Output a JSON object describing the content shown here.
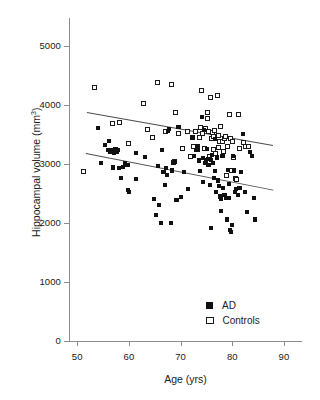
{
  "chart_data": {
    "type": "scatter",
    "title": "",
    "xlabel": "Age (yrs)",
    "ylabel_text": "Hippocampal volume (mm",
    "ylabel_sup": "3",
    "ylabel_tail": ")",
    "xlim": [
      50,
      95
    ],
    "ylim": [
      0,
      5400
    ],
    "xticks": [
      50,
      60,
      70,
      80,
      90
    ],
    "yticks": [
      0,
      1000,
      2000,
      3000,
      4000,
      5000
    ],
    "xtick_labels": [
      "50",
      "60",
      "70",
      "80",
      "90"
    ],
    "ytick_labels": [
      "0",
      "1000",
      "2000",
      "3000",
      "4000",
      "5000"
    ],
    "grid": false,
    "legend_position": "lower-right",
    "series": [
      {
        "name": "AD",
        "marker": "filled-square",
        "color": "#111111",
        "points": [
          [
            54.1,
            3610
          ],
          [
            54.6,
            3020
          ],
          [
            55.4,
            3320
          ],
          [
            55.9,
            3240
          ],
          [
            56.2,
            3390
          ],
          [
            56.4,
            3200
          ],
          [
            56.7,
            3230
          ],
          [
            56.9,
            2940
          ],
          [
            57.1,
            3180
          ],
          [
            57.4,
            3260
          ],
          [
            57.6,
            3210
          ],
          [
            57.9,
            3230
          ],
          [
            58.1,
            2930
          ],
          [
            58.4,
            2760
          ],
          [
            58.9,
            2950
          ],
          [
            59.3,
            3010
          ],
          [
            59.6,
            2990
          ],
          [
            59.8,
            2990
          ],
          [
            59.9,
            2560
          ],
          [
            60.1,
            2520
          ],
          [
            61.3,
            3190
          ],
          [
            61.4,
            2750
          ],
          [
            63.2,
            3120
          ],
          [
            64.8,
            2410
          ],
          [
            65.2,
            2130
          ],
          [
            65.6,
            2960
          ],
          [
            65.9,
            2310
          ],
          [
            66.2,
            2000
          ],
          [
            66.4,
            3240
          ],
          [
            66.7,
            2870
          ],
          [
            66.9,
            2650
          ],
          [
            67.1,
            2930
          ],
          [
            67.4,
            2810
          ],
          [
            67.6,
            3560
          ],
          [
            67.8,
            3590
          ],
          [
            68.2,
            2000
          ],
          [
            68.4,
            2890
          ],
          [
            68.9,
            3030
          ],
          [
            69.2,
            2390
          ],
          [
            69.6,
            3620
          ],
          [
            70.1,
            2440
          ],
          [
            70.6,
            2870
          ],
          [
            71.4,
            2570
          ],
          [
            72.3,
            3450
          ],
          [
            72.6,
            3140
          ],
          [
            72.9,
            3240
          ],
          [
            73.1,
            3300
          ],
          [
            73.4,
            3230
          ],
          [
            73.6,
            3060
          ],
          [
            73.8,
            2880
          ],
          [
            74.1,
            3790
          ],
          [
            74.3,
            3100
          ],
          [
            74.4,
            2700
          ],
          [
            74.6,
            3570
          ],
          [
            74.8,
            3020
          ],
          [
            74.9,
            3060
          ],
          [
            75.1,
            3250
          ],
          [
            75.3,
            3090
          ],
          [
            75.4,
            2980
          ],
          [
            75.6,
            3080
          ],
          [
            75.7,
            2650
          ],
          [
            75.8,
            1920
          ],
          [
            75.9,
            3070
          ],
          [
            76.1,
            3160
          ],
          [
            76.3,
            3020
          ],
          [
            76.4,
            2760
          ],
          [
            76.6,
            2880
          ],
          [
            76.7,
            3420
          ],
          [
            76.9,
            2520
          ],
          [
            77.1,
            3110
          ],
          [
            77.3,
            2720
          ],
          [
            77.4,
            2630
          ],
          [
            77.6,
            2450
          ],
          [
            77.8,
            2410
          ],
          [
            77.9,
            2200
          ],
          [
            78.1,
            3140
          ],
          [
            78.2,
            2600
          ],
          [
            78.4,
            2480
          ],
          [
            78.6,
            2470
          ],
          [
            78.7,
            2420
          ],
          [
            78.9,
            2060
          ],
          [
            79.1,
            2900
          ],
          [
            79.3,
            2660
          ],
          [
            79.4,
            2420
          ],
          [
            79.6,
            1880
          ],
          [
            79.7,
            1840
          ],
          [
            79.9,
            1970
          ],
          [
            80.2,
            3140
          ],
          [
            80.4,
            2890
          ],
          [
            80.6,
            2530
          ],
          [
            80.8,
            2580
          ],
          [
            81.1,
            2470
          ],
          [
            81.4,
            2600
          ],
          [
            81.6,
            2860
          ],
          [
            82.1,
            3510
          ],
          [
            82.4,
            2520
          ],
          [
            82.9,
            2190
          ],
          [
            83.4,
            3210
          ],
          [
            83.8,
            3130
          ],
          [
            84.2,
            2420
          ],
          [
            84.4,
            2060
          ]
        ]
      },
      {
        "name": "Controls",
        "marker": "open-square",
        "color": "#ffffff",
        "points": [
          [
            51.3,
            2870
          ],
          [
            53.3,
            4290
          ],
          [
            56.9,
            3690
          ],
          [
            58.1,
            3700
          ],
          [
            59.9,
            3340
          ],
          [
            62.9,
            4030
          ],
          [
            63.6,
            3590
          ],
          [
            64.6,
            3450
          ],
          [
            65.6,
            4390
          ],
          [
            67.1,
            3560
          ],
          [
            68.3,
            4350
          ],
          [
            68.6,
            3030
          ],
          [
            68.8,
            3040
          ],
          [
            69.1,
            3880
          ],
          [
            69.6,
            3510
          ],
          [
            70.4,
            3270
          ],
          [
            71.3,
            3560
          ],
          [
            71.9,
            3120
          ],
          [
            72.4,
            3290
          ],
          [
            72.9,
            3550
          ],
          [
            73.3,
            3300
          ],
          [
            73.6,
            3450
          ],
          [
            73.9,
            3620
          ],
          [
            74.1,
            4250
          ],
          [
            74.3,
            3520
          ],
          [
            74.6,
            3270
          ],
          [
            74.9,
            3610
          ],
          [
            75.1,
            3770
          ],
          [
            75.2,
            3880
          ],
          [
            75.4,
            3560
          ],
          [
            75.6,
            3130
          ],
          [
            75.8,
            4120
          ],
          [
            75.9,
            3440
          ],
          [
            76.1,
            3530
          ],
          [
            76.3,
            3460
          ],
          [
            76.4,
            3240
          ],
          [
            76.6,
            3570
          ],
          [
            76.8,
            3180
          ],
          [
            77.1,
            4160
          ],
          [
            77.3,
            3480
          ],
          [
            77.4,
            3280
          ],
          [
            77.6,
            3390
          ],
          [
            77.8,
            3630
          ],
          [
            78.1,
            3380
          ],
          [
            78.3,
            3210
          ],
          [
            78.4,
            3440
          ],
          [
            78.6,
            3470
          ],
          [
            78.8,
            2810
          ],
          [
            79.1,
            3300
          ],
          [
            79.4,
            3840
          ],
          [
            79.6,
            3430
          ],
          [
            79.8,
            2890
          ],
          [
            80.1,
            3380
          ],
          [
            80.3,
            3110
          ],
          [
            80.6,
            2750
          ],
          [
            80.8,
            2740
          ],
          [
            81.1,
            3840
          ],
          [
            81.4,
            3270
          ],
          [
            82.1,
            3370
          ],
          [
            82.6,
            3290
          ],
          [
            83.1,
            3290
          ]
        ]
      }
    ],
    "trendlines": [
      {
        "name": "Controls-fit",
        "for_series": "Controls",
        "x_start": 51.8,
        "y_start": 3880,
        "x_end": 87.8,
        "y_end": 3320
      },
      {
        "name": "AD-fit",
        "for_series": "AD",
        "x_start": 51.6,
        "y_start": 3180,
        "x_end": 87.8,
        "y_end": 2560
      }
    ],
    "legend": [
      {
        "label": "AD",
        "marker": "filled-square"
      },
      {
        "label": "Controls",
        "marker": "open-square"
      }
    ]
  }
}
